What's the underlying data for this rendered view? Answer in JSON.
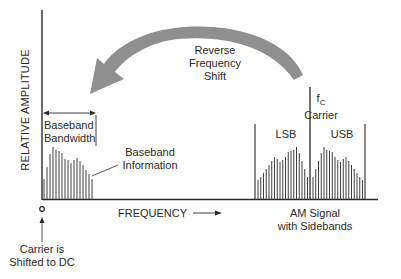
{
  "labels": {
    "y_axis": "RELATIVE AMPLITUDE",
    "x_axis": "FREQUENCY",
    "arrow_line1": "Reverse",
    "arrow_line2": "Frequency",
    "arrow_line3": "Shift",
    "carrier_symbol": "f",
    "carrier_subscript": "C",
    "carrier_label": "Carrier",
    "lsb": "LSB",
    "usb": "USB",
    "bandwidth_line1": "Baseband",
    "bandwidth_line2": "Bandwidth",
    "info_line1": "Baseband",
    "info_line2": "Information",
    "am_line1": "AM Signal",
    "am_line2": "with Sidebands",
    "dc_line1": "Carrier is",
    "dc_line2": "Shifted to DC"
  },
  "colors": {
    "ink": "#2a2a2a",
    "arrow": "#8f8f8f",
    "background": "#ffffff"
  },
  "spectra": {
    "baseband_bar_heights": [
      20,
      32,
      45,
      52,
      49,
      48,
      46,
      40,
      39,
      36,
      39,
      41,
      38,
      34,
      29,
      25,
      20
    ],
    "usb_bar_heights": [
      22,
      30,
      38,
      46,
      52,
      49,
      48,
      47,
      42,
      39,
      37,
      40,
      42,
      38,
      34,
      30,
      26,
      22,
      19
    ],
    "lsb_bar_heights": [
      19,
      22,
      26,
      30,
      34,
      38,
      42,
      40,
      37,
      39,
      42,
      47,
      48,
      49,
      52,
      46,
      38,
      30,
      22
    ],
    "carrier_height": 112,
    "band_edge_height": 75
  }
}
